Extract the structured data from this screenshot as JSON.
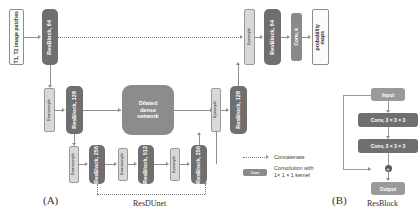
{
  "figure": {
    "panel_a": {
      "letter": "(A)",
      "caption": "ResDUnet"
    },
    "panel_b": {
      "letter": "(B)",
      "caption": "ResBlock"
    }
  },
  "panel_a": {
    "input": {
      "label": "T1, T2 image\npatches"
    },
    "output": {
      "label": "probability\nmaps"
    },
    "encoder": [
      {
        "name": "resblock-64-enc",
        "label": "ResBlock, 64"
      },
      {
        "name": "resblock-128-enc",
        "label": "ResBlock, 128"
      },
      {
        "name": "resblock-256-enc",
        "label": "ResBlock, 256"
      },
      {
        "name": "resblock-512",
        "label": "ResBlock, 512"
      }
    ],
    "decoder": [
      {
        "name": "resblock-256-dec",
        "label": "ResBlock, 256"
      },
      {
        "name": "resblock-128-dec",
        "label": "ResBlock, 128"
      },
      {
        "name": "resblock-64-dec",
        "label": "ResBlock, 64"
      }
    ],
    "bridge": {
      "name": "dilated-dense-network",
      "label": "Dilated\ndense\nnetwork"
    },
    "final_conv": {
      "name": "conv-k",
      "label": "Conv, k"
    },
    "sampling": [
      {
        "name": "downsample-1",
        "label": "Downsample"
      },
      {
        "name": "downsample-2",
        "label": "Downsample"
      },
      {
        "name": "downsample-3",
        "label": "Downsample"
      },
      {
        "name": "upsample-1",
        "label": "Upsample"
      },
      {
        "name": "upsample-2",
        "label": "Upsample"
      },
      {
        "name": "upsample-3",
        "label": "Upsample"
      }
    ]
  },
  "panel_b": {
    "input": "Input",
    "conv1": "Conv, 3 × 3 × 3",
    "conv2": "Conv, 3 × 3 × 3",
    "sum": "+",
    "output": "Output"
  },
  "legend": {
    "concatenate": {
      "label": "Concatenate"
    },
    "convolution": {
      "label": "Convolution with\n1× 1 × 1 kernel",
      "swatch_label": "Conv"
    }
  },
  "colors": {
    "resblock": "#6f6f6f",
    "dense": "#8c8c8c",
    "sampling_bar": "#d8d8d8",
    "io_box": "#fbfbfb",
    "connector": "#8e8e8e",
    "dotted": "#7b7b7b",
    "background": "#ffffff"
  }
}
